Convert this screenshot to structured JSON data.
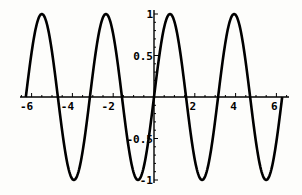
{
  "chart_data": {
    "type": "line",
    "title": "",
    "xlabel": "",
    "ylabel": "",
    "function": "sin(2x)",
    "xlim": [
      -6.6,
      6.5
    ],
    "ylim": [
      -1,
      1
    ],
    "x_range_plotted": [
      -6.283,
      6.283
    ],
    "x_ticks": [
      -6,
      -4,
      -2,
      2,
      4,
      6
    ],
    "x_tick_labels": [
      "-6",
      "-4",
      "-2",
      "2",
      "4",
      "6"
    ],
    "y_ticks": [
      -1,
      -0.5,
      0.5,
      1
    ],
    "y_tick_labels": [
      "-1",
      "-0.5",
      "0.5",
      "1"
    ],
    "grid": false,
    "legend": null,
    "series": [
      {
        "name": "sin(2x)",
        "color": "#000000",
        "x": [
          -6.283,
          -5.498,
          -4.712,
          -3.927,
          -3.142,
          -2.356,
          -1.571,
          -0.785,
          0,
          0.785,
          1.571,
          2.356,
          3.142,
          3.927,
          4.712,
          5.498,
          6.283
        ],
        "values": [
          0,
          1,
          0,
          -1,
          0,
          1,
          0,
          -1,
          0,
          1,
          0,
          -1,
          0,
          1,
          0,
          -1,
          0
        ]
      }
    ]
  },
  "colors": {
    "line": "#000000",
    "background": "#fdfdfb"
  }
}
